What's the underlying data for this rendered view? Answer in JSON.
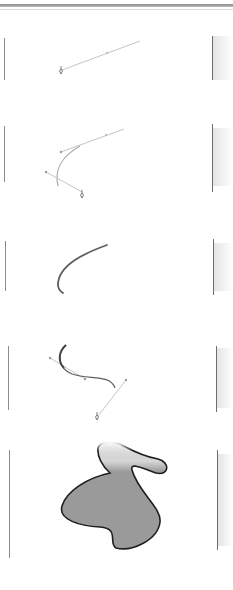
{
  "figure": {
    "panels": [
      {
        "step": 1,
        "label": "Click and drag to set first anchor and direction handle"
      },
      {
        "step": 2,
        "label": "Second anchor creates curved segment"
      },
      {
        "step": 3,
        "label": "Resulting curve"
      },
      {
        "step": 4,
        "label": "Continue adding anchor points with handles"
      },
      {
        "step": 5,
        "label": "Closed filled shape"
      }
    ],
    "colors": {
      "handle_line": "#bdbdbd",
      "curve_stroke": "#6a6a6a",
      "shape_fill": "#9a9a9a",
      "shape_stroke": "#1e1e1e",
      "frame": "#8c8c8c"
    }
  }
}
